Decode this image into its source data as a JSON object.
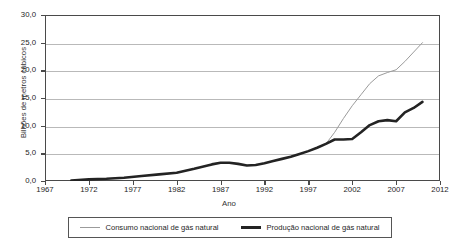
{
  "chart_data": {
    "type": "line",
    "title": "",
    "xlabel": "Ano",
    "ylabel": "Bilhões de metros cúbicos",
    "xlim": [
      1967,
      2012
    ],
    "ylim": [
      0.0,
      30.0
    ],
    "grid": true,
    "legend_position": "bottom",
    "xticks": [
      "1967",
      "1972",
      "1977",
      "1982",
      "1987",
      "1992",
      "1997",
      "2002",
      "2007",
      "2012"
    ],
    "xtick_values": [
      1967,
      1972,
      1977,
      1982,
      1987,
      1992,
      1997,
      2002,
      2007,
      2012
    ],
    "yticks": [
      "0,0",
      "5,0",
      "10,0",
      "15,0",
      "20,0",
      "25,0",
      "30,0"
    ],
    "ytick_values": [
      0.0,
      5.0,
      10.0,
      15.0,
      20.0,
      25.0,
      30.0
    ],
    "series": [
      {
        "name": "Consumo nacional de gás natural",
        "color": "#9b9b9b",
        "width": 1.0,
        "x": [
          1970,
          1972,
          1974,
          1976,
          1978,
          1980,
          1982,
          1984,
          1986,
          1987,
          1988,
          1989,
          1990,
          1991,
          1992,
          1993,
          1994,
          1995,
          1996,
          1997,
          1998,
          1999,
          2000,
          2001,
          2002,
          2003,
          2004,
          2005,
          2006,
          2007,
          2008,
          2009,
          2010
        ],
        "y": [
          0.1,
          0.3,
          0.4,
          0.6,
          0.9,
          1.2,
          1.5,
          2.2,
          3.0,
          3.3,
          3.3,
          3.1,
          2.8,
          2.9,
          3.2,
          3.6,
          4.0,
          4.4,
          4.9,
          5.4,
          6.0,
          6.7,
          8.8,
          11.3,
          13.6,
          15.6,
          17.6,
          19.0,
          19.6,
          20.1,
          21.6,
          23.3,
          25.0
        ]
      },
      {
        "name": "Produção nacional de gás natural",
        "color": "#232323",
        "width": 2.6,
        "x": [
          1970,
          1972,
          1974,
          1976,
          1978,
          1980,
          1982,
          1984,
          1986,
          1987,
          1988,
          1989,
          1990,
          1991,
          1992,
          1993,
          1994,
          1995,
          1996,
          1997,
          1998,
          1999,
          2000,
          2001,
          2002,
          2003,
          2004,
          2005,
          2006,
          2007,
          2008,
          2009,
          2010
        ],
        "y": [
          0.1,
          0.3,
          0.4,
          0.6,
          0.9,
          1.2,
          1.5,
          2.2,
          3.0,
          3.3,
          3.3,
          3.1,
          2.8,
          2.9,
          3.2,
          3.6,
          4.0,
          4.4,
          4.9,
          5.4,
          6.0,
          6.7,
          7.5,
          7.5,
          7.6,
          8.8,
          10.1,
          10.8,
          11.0,
          10.8,
          12.4,
          13.2,
          14.3
        ]
      }
    ]
  },
  "legend": {
    "entries": [
      {
        "label": "Consumo nacional de gás natural",
        "swatch": "thin-gray-line"
      },
      {
        "label": "Produção nacional de gás natural",
        "swatch": "thick-black-line"
      }
    ]
  }
}
